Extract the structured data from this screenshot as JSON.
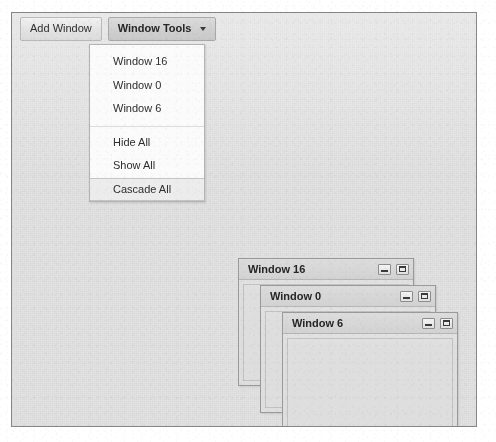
{
  "toolbar": {
    "add_window_label": "Add Window",
    "window_tools_label": "Window Tools",
    "caret_icon": "chevron-down-icon"
  },
  "menu": {
    "items": [
      {
        "label": "Window 16",
        "type": "window",
        "hovered": false
      },
      {
        "label": "Window 0",
        "type": "window",
        "hovered": false
      },
      {
        "label": "Window 6",
        "type": "window",
        "hovered": false
      },
      {
        "label": "Hide All",
        "type": "action",
        "hovered": false
      },
      {
        "label": "Show All",
        "type": "action",
        "hovered": false
      },
      {
        "label": "Cascade All",
        "type": "action",
        "hovered": true
      }
    ]
  },
  "windows": [
    {
      "title": "Window 16",
      "minimize_icon": "minimize-icon",
      "maximize_icon": "maximize-icon"
    },
    {
      "title": "Window 0",
      "minimize_icon": "minimize-icon",
      "maximize_icon": "maximize-icon"
    },
    {
      "title": "Window 6",
      "minimize_icon": "minimize-icon",
      "maximize_icon": "maximize-icon"
    }
  ],
  "colors": {
    "desktop_background": "#e2e2e2",
    "desktop_border": "#868686",
    "titlebar": "#d6d6d6",
    "menu_background": "#fbfbfb",
    "menu_hover": "#ececec",
    "text": "#2e2e2e"
  }
}
